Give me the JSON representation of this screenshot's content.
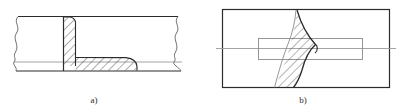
{
  "figure": {
    "background_color": "#ffffff",
    "line_color": "#2b2b2b",
    "thin_line_color": "#9a9a9a",
    "hatch_color": "#4a4a4a",
    "panels": [
      {
        "id": "a",
        "caption": "a)",
        "description": "sectional side view of T-joint with fillet weld, plate shown with break lines at both ends",
        "elements": [
          "upper-plate-outline",
          "lower-plate-outline",
          "vertical-plate-hatched",
          "fillet-weld-hatched",
          "left-break-line",
          "right-break-line"
        ]
      },
      {
        "id": "b",
        "caption": "b)",
        "description": "plan view rectangle with hatched weld seam band and inner rectangle outline on centre line",
        "elements": [
          "outer-rectangle",
          "inner-rectangle",
          "centre-line",
          "weld-seam-hatched",
          "seam-boundary-left",
          "seam-boundary-right"
        ]
      }
    ]
  }
}
